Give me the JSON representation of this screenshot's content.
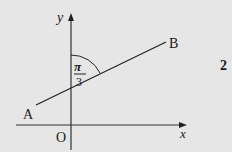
{
  "figure": {
    "problem_number": "2",
    "axes": {
      "x_label": "x",
      "y_label": "y",
      "origin_label": "O"
    },
    "points": {
      "a_label": "A",
      "b_label": "B"
    },
    "angle": {
      "numerator": "π",
      "denominator": "3"
    }
  },
  "colors": {
    "background": "#e6e6e6",
    "ink": "#1a1a1a"
  }
}
